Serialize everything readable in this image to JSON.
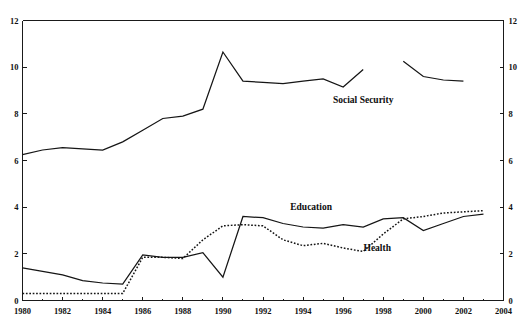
{
  "chart_data": {
    "type": "line",
    "title": "",
    "subtitle": "",
    "xlabel": "",
    "ylabel": "",
    "xlim": [
      1980,
      2004
    ],
    "ylim": [
      0,
      12
    ],
    "grid": false,
    "legend_position": "inline-annotations",
    "x_ticks": [
      1980,
      1982,
      1984,
      1986,
      1988,
      1990,
      1992,
      1994,
      1996,
      1998,
      2000,
      2002,
      2004
    ],
    "x_tick_labels": [
      "1980",
      "1982",
      "1984",
      "1986",
      "1988",
      "1990",
      "1992",
      "1994",
      "1996",
      "1998",
      "2000",
      "2002",
      "2004"
    ],
    "x_minor_ticks": [
      1981,
      1983,
      1985,
      1987,
      1989,
      1991,
      1993,
      1995,
      1997,
      1999,
      2001,
      2003
    ],
    "y_ticks": [
      0,
      2,
      4,
      6,
      8,
      10,
      12
    ],
    "y_tick_labels": [
      "0",
      "2",
      "4",
      "6",
      "8",
      "10",
      "12"
    ],
    "y_ticks_right": [
      0,
      2,
      4,
      6,
      8,
      10,
      12
    ],
    "y_tick_labels_right": [
      "0",
      "2",
      "4",
      "6",
      "8",
      "10",
      "12"
    ],
    "series": [
      {
        "name": "Social Security",
        "style": "solid",
        "label_text": "Social Security",
        "x": [
          1980,
          1981,
          1982,
          1983,
          1984,
          1985,
          1986,
          1987,
          1988,
          1989,
          1990,
          1991,
          1992,
          1993,
          1994,
          1995,
          1996,
          1997
        ],
        "values": [
          6.25,
          6.45,
          6.55,
          6.5,
          6.45,
          6.8,
          7.3,
          7.8,
          7.9,
          8.2,
          10.65,
          9.4,
          9.35,
          9.3,
          9.4,
          9.5,
          9.15,
          9.9
        ],
        "x2": [
          1999,
          2000,
          2001,
          2002
        ],
        "values2": [
          10.25,
          9.6,
          9.45,
          9.4
        ]
      },
      {
        "name": "Education",
        "style": "solid",
        "label_text": "Education",
        "x": [
          1980,
          1981,
          1982,
          1983,
          1984,
          1985,
          1986,
          1987,
          1988,
          1989,
          1990,
          1991,
          1992,
          1993,
          1994,
          1995,
          1996,
          1997,
          1998,
          1999,
          2000,
          2001,
          2002,
          2003
        ],
        "values": [
          1.4,
          1.25,
          1.1,
          0.85,
          0.75,
          0.7,
          1.95,
          1.85,
          1.85,
          2.05,
          1.0,
          3.6,
          3.55,
          3.3,
          3.15,
          3.1,
          3.25,
          3.15,
          3.5,
          3.55,
          3.0,
          3.3,
          3.6,
          3.7
        ]
      },
      {
        "name": "Health",
        "style": "dotted",
        "label_text": "Health",
        "x": [
          1980,
          1981,
          1982,
          1983,
          1984,
          1985,
          1986,
          1987,
          1988,
          1989,
          1990,
          1991,
          1992,
          1993,
          1994,
          1995,
          1996,
          1997,
          1998,
          1999,
          2000,
          2001,
          2002,
          2003
        ],
        "values": [
          0.3,
          0.3,
          0.3,
          0.3,
          0.3,
          0.3,
          1.85,
          1.85,
          1.8,
          2.6,
          3.2,
          3.25,
          3.2,
          2.6,
          2.35,
          2.45,
          2.25,
          2.1,
          2.85,
          3.5,
          3.6,
          3.75,
          3.8,
          3.85
        ]
      }
    ],
    "annotations": [
      {
        "text": "Social Security",
        "x": 1997.0,
        "y": 8.55
      },
      {
        "text": "Education",
        "x": 1994.4,
        "y": 3.98
      },
      {
        "text": "Health",
        "x": 1997.7,
        "y": 2.2
      }
    ]
  }
}
